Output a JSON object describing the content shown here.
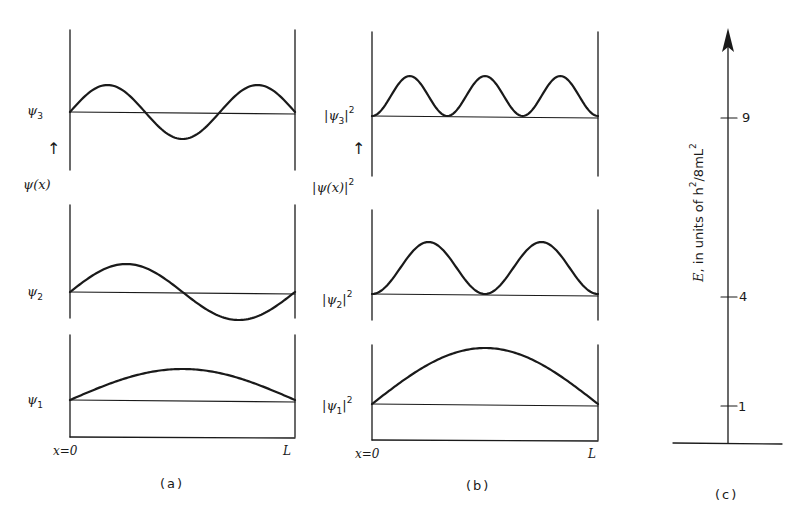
{
  "figure": {
    "panel_a": {
      "caption": "(a)",
      "axis_label": "ψ(x)",
      "x_start": "x=0",
      "x_end": "L",
      "rows": [
        {
          "label": "ψ",
          "sub": "3",
          "n": 3
        },
        {
          "label": "ψ",
          "sub": "2",
          "n": 2
        },
        {
          "label": "ψ",
          "sub": "1",
          "n": 1
        }
      ]
    },
    "panel_b": {
      "caption": "(b)",
      "axis_label": "|ψ(x)|",
      "axis_label_sup": "2",
      "x_start": "x=0",
      "x_end": "L",
      "rows": [
        {
          "label": "|ψ",
          "sub": "3",
          "close": "|",
          "sup": "2",
          "n": 3
        },
        {
          "label": "|ψ",
          "sub": "2",
          "close": "|",
          "sup": "2",
          "n": 2
        },
        {
          "label": "|ψ",
          "sub": "1",
          "close": "|",
          "sup": "2",
          "n": 1
        }
      ]
    },
    "panel_c": {
      "caption": "(c)",
      "axis_label_prefix": "E",
      "axis_label_text": ", in units of h",
      "axis_label_sup": "2",
      "axis_label_tail": "/8mL",
      "axis_label_sup2": "2",
      "ticks": [
        {
          "value": "9",
          "level": 9
        },
        {
          "value": "4",
          "level": 4
        },
        {
          "value": "1",
          "level": 1
        }
      ]
    }
  },
  "chart_data": {
    "type": "line",
    "panels": [
      {
        "id": "a",
        "xlabel": "x (0 to L)",
        "ylabel": "ψ(x)",
        "series": [
          {
            "name": "ψ1",
            "function": "sin(πx/L)"
          },
          {
            "name": "ψ2",
            "function": "sin(2πx/L)"
          },
          {
            "name": "ψ3",
            "function": "sin(3πx/L)"
          }
        ]
      },
      {
        "id": "b",
        "xlabel": "x (0 to L)",
        "ylabel": "|ψ(x)|^2",
        "series": [
          {
            "name": "|ψ1|^2",
            "function": "sin^2(πx/L)"
          },
          {
            "name": "|ψ2|^2",
            "function": "sin^2(2πx/L)"
          },
          {
            "name": "|ψ3|^2",
            "function": "sin^2(3πx/L)"
          }
        ]
      },
      {
        "id": "c",
        "ylabel": "E, in units of h^2/8mL^2",
        "levels": [
          1,
          4,
          9
        ]
      }
    ]
  }
}
